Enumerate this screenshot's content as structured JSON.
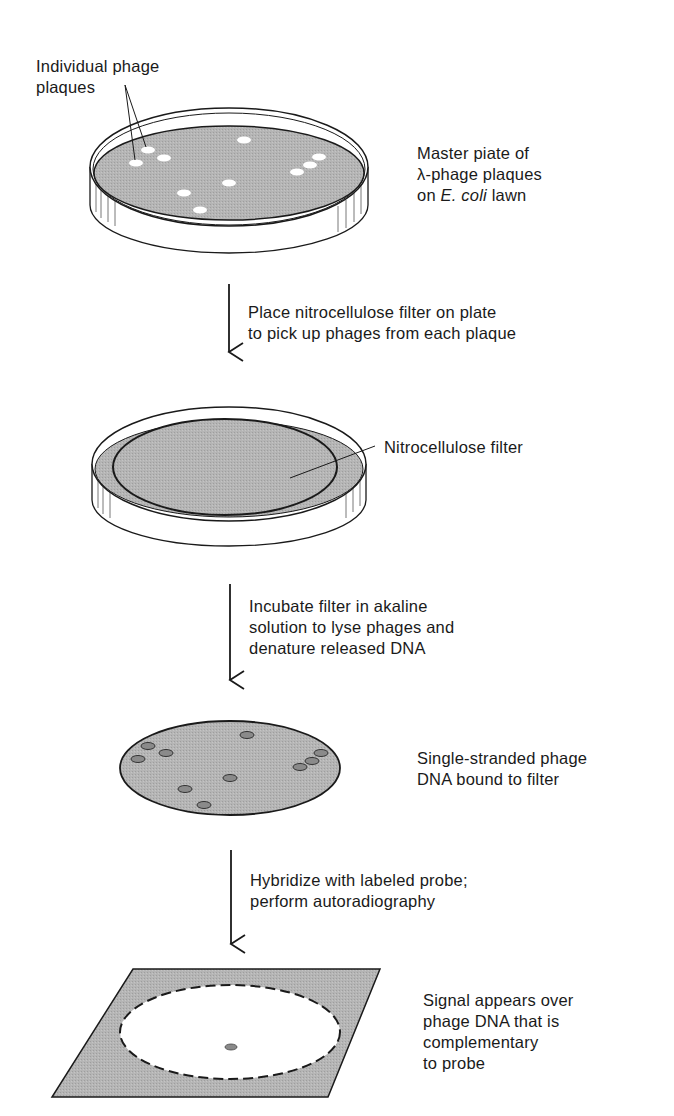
{
  "figure": {
    "type": "flow-diagram"
  },
  "labels": {
    "plaques_callout": [
      "Individual phage",
      "plaques"
    ],
    "master_plate": {
      "line1": "Master piate of",
      "line2": "λ-phage plaques",
      "line3_prefix": "on ",
      "line3_italic": "E. coli",
      "line3_suffix": " lawn"
    },
    "step1": [
      "Place nitrocellulose filter on plate",
      "to pick up phages from each plaque"
    ],
    "filter_callout": "Nitrocellulose filter",
    "step2": [
      "Incubate filter in akaline",
      "solution to lyse phages and",
      "denature released DNA"
    ],
    "bound_dna": [
      "Single-stranded phage",
      "DNA bound to filter"
    ],
    "step3": [
      "Hybridize with labeled probe;",
      "perform autoradiography"
    ],
    "signal": [
      "Signal appears over",
      "phage DNA that is",
      "complementary",
      "to probe"
    ]
  },
  "plaques": [
    {
      "x": 136,
      "y": 163
    },
    {
      "x": 148,
      "y": 150
    },
    {
      "x": 164,
      "y": 158
    },
    {
      "x": 244,
      "y": 140
    },
    {
      "x": 229,
      "y": 183
    },
    {
      "x": 184,
      "y": 193
    },
    {
      "x": 200,
      "y": 210
    },
    {
      "x": 297,
      "y": 172
    },
    {
      "x": 310,
      "y": 165
    },
    {
      "x": 319,
      "y": 157
    }
  ],
  "filter_spots": [
    {
      "x": 148,
      "y": 746
    },
    {
      "x": 138,
      "y": 759
    },
    {
      "x": 166,
      "y": 753
    },
    {
      "x": 247,
      "y": 735
    },
    {
      "x": 230,
      "y": 778
    },
    {
      "x": 185,
      "y": 789
    },
    {
      "x": 204,
      "y": 805
    },
    {
      "x": 300,
      "y": 767
    },
    {
      "x": 312,
      "y": 761
    },
    {
      "x": 321,
      "y": 753
    }
  ],
  "signal_spot": {
    "x": 231,
    "y": 1047
  },
  "colors": {
    "lawn_gray": "#b3b3b3",
    "line": "#1a1a1a",
    "plaque_white": "#ffffff",
    "spot_gray": "#8a8a8a"
  }
}
